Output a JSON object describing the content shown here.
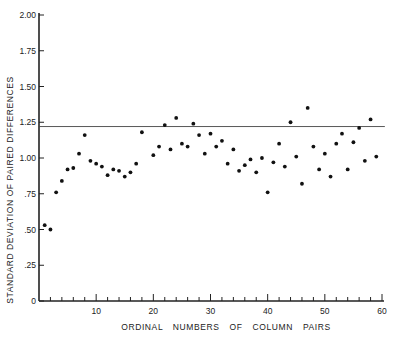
{
  "chart_data": {
    "type": "scatter",
    "title": "",
    "xlabel": "ORDINAL NUMBERS OF COLUMN PAIRS",
    "ylabel": "STANDARD DEVIATION OF PAIRED DIFFERENCES",
    "xlim": [
      0,
      60
    ],
    "ylim": [
      0,
      2.0
    ],
    "x_ticks": [
      10,
      20,
      30,
      40,
      50,
      60
    ],
    "y_ticks": [
      {
        "value": 0,
        "label": "0"
      },
      {
        "value": 0.25,
        "label": ".25"
      },
      {
        "value": 0.5,
        "label": ".50"
      },
      {
        "value": 0.75,
        "label": ".75"
      },
      {
        "value": 1.0,
        "label": "1.00"
      },
      {
        "value": 1.25,
        "label": "1.25"
      },
      {
        "value": 1.5,
        "label": "1.50"
      },
      {
        "value": 1.75,
        "label": "1.75"
      },
      {
        "value": 2.0,
        "label": "2.00"
      }
    ],
    "grid": false,
    "legend": null,
    "reference_line": {
      "y": 1.22,
      "x_start": 0,
      "x_end": 60.5
    },
    "series": [
      {
        "name": "SD of paired differences",
        "points": [
          [
            1,
            0.53
          ],
          [
            2,
            0.5
          ],
          [
            3,
            0.76
          ],
          [
            4,
            0.84
          ],
          [
            5,
            0.92
          ],
          [
            6,
            0.93
          ],
          [
            7,
            1.03
          ],
          [
            8,
            1.16
          ],
          [
            9,
            0.98
          ],
          [
            10,
            0.96
          ],
          [
            11,
            0.94
          ],
          [
            12,
            0.88
          ],
          [
            13,
            0.92
          ],
          [
            14,
            0.91
          ],
          [
            15,
            0.87
          ],
          [
            16,
            0.9
          ],
          [
            17,
            0.96
          ],
          [
            18,
            1.18
          ],
          [
            20,
            1.02
          ],
          [
            21,
            1.08
          ],
          [
            22,
            1.23
          ],
          [
            23,
            1.06
          ],
          [
            24,
            1.28
          ],
          [
            25,
            1.1
          ],
          [
            26,
            1.08
          ],
          [
            27,
            1.24
          ],
          [
            28,
            1.16
          ],
          [
            29,
            1.03
          ],
          [
            30,
            1.17
          ],
          [
            31,
            1.08
          ],
          [
            32,
            1.12
          ],
          [
            33,
            0.96
          ],
          [
            34,
            1.06
          ],
          [
            35,
            0.91
          ],
          [
            36,
            0.95
          ],
          [
            37,
            0.99
          ],
          [
            38,
            0.9
          ],
          [
            39,
            1.0
          ],
          [
            40,
            0.76
          ],
          [
            41,
            0.97
          ],
          [
            42,
            1.1
          ],
          [
            43,
            0.94
          ],
          [
            44,
            1.25
          ],
          [
            45,
            1.01
          ],
          [
            46,
            0.82
          ],
          [
            47,
            1.35
          ],
          [
            48,
            1.08
          ],
          [
            49,
            0.92
          ],
          [
            50,
            1.03
          ],
          [
            51,
            0.87
          ],
          [
            52,
            1.1
          ],
          [
            53,
            1.17
          ],
          [
            54,
            0.92
          ],
          [
            55,
            1.11
          ],
          [
            56,
            1.21
          ],
          [
            57,
            0.98
          ],
          [
            58,
            1.27
          ],
          [
            59,
            1.01
          ]
        ]
      }
    ]
  }
}
